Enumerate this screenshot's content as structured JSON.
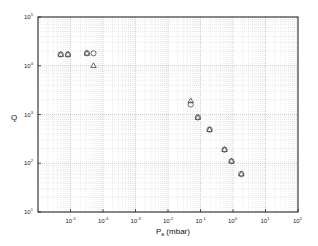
{
  "chart_data": {
    "type": "scatter",
    "title": "",
    "xlabel": "P",
    "xlabel_sub": "a",
    "xlabel_unit": " (mbar)",
    "ylabel": "Q",
    "xscale": "log",
    "yscale": "log",
    "xlim": [
      1e-06,
      100.0
    ],
    "ylim": [
      10.0,
      100000.0
    ],
    "grid": true,
    "x_ticks": [
      {
        "base": "10",
        "exp": "-5",
        "value": 1e-05
      },
      {
        "base": "10",
        "exp": "-4",
        "value": 0.0001
      },
      {
        "base": "10",
        "exp": "-3",
        "value": 0.001
      },
      {
        "base": "10",
        "exp": "-2",
        "value": 0.01
      },
      {
        "base": "10",
        "exp": "-1",
        "value": 0.1
      },
      {
        "base": "10",
        "exp": "0",
        "value": 1
      },
      {
        "base": "10",
        "exp": "1",
        "value": 10
      },
      {
        "base": "10",
        "exp": "2",
        "value": 100
      }
    ],
    "y_ticks": [
      {
        "base": "10",
        "exp": "1",
        "value": 10
      },
      {
        "base": "10",
        "exp": "2",
        "value": 100
      },
      {
        "base": "10",
        "exp": "3",
        "value": 1000
      },
      {
        "base": "10",
        "exp": "4",
        "value": 10000
      },
      {
        "base": "10",
        "exp": "5",
        "value": 100000
      }
    ],
    "series": [
      {
        "name": "circles",
        "marker": "circle",
        "points": [
          {
            "x": 5e-06,
            "y": 17000
          },
          {
            "x": 8.3e-06,
            "y": 17000
          },
          {
            "x": 3.2e-05,
            "y": 18000
          },
          {
            "x": 5.1e-05,
            "y": 18000
          },
          {
            "x": 0.05,
            "y": 1600
          },
          {
            "x": 0.083,
            "y": 870
          },
          {
            "x": 0.19,
            "y": 490
          },
          {
            "x": 0.55,
            "y": 190
          },
          {
            "x": 0.9,
            "y": 110
          },
          {
            "x": 1.8,
            "y": 60
          }
        ]
      },
      {
        "name": "triangles",
        "marker": "triangle",
        "points": [
          {
            "x": 5e-06,
            "y": 17000
          },
          {
            "x": 8.3e-06,
            "y": 17000
          },
          {
            "x": 3.2e-05,
            "y": 18000
          },
          {
            "x": 5.1e-05,
            "y": 10000
          },
          {
            "x": 0.05,
            "y": 1900
          },
          {
            "x": 0.083,
            "y": 870
          },
          {
            "x": 0.19,
            "y": 490
          },
          {
            "x": 0.55,
            "y": 190
          },
          {
            "x": 0.9,
            "y": 110
          },
          {
            "x": 1.8,
            "y": 60
          }
        ]
      }
    ],
    "legend": "none"
  }
}
